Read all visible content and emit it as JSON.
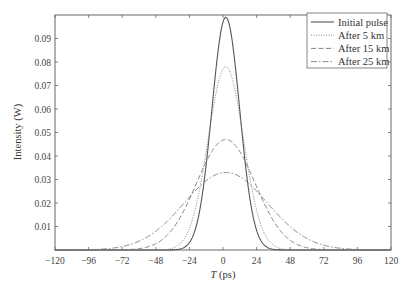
{
  "chart_data": {
    "type": "line",
    "title": "",
    "xlabel": "T (ps)",
    "xlabel_italic": "T",
    "xlabel_unit": " (ps)",
    "ylabel": "Intensity (W)",
    "xlim": [
      -120,
      120
    ],
    "ylim": [
      0,
      0.1
    ],
    "xticks": [
      -120,
      -96,
      -72,
      -48,
      -24,
      0,
      24,
      48,
      72,
      96,
      120
    ],
    "xtick_labels": [
      "−120",
      "−96",
      "−72",
      "−48",
      "−24",
      "0",
      "24",
      "48",
      "72",
      "96",
      "120"
    ],
    "yticks": [
      0.01,
      0.02,
      0.03,
      0.04,
      0.05,
      0.06,
      0.07,
      0.08,
      0.09
    ],
    "ytick_labels": [
      "0.01",
      "0.02",
      "0.03",
      "0.04",
      "0.05",
      "0.06",
      "0.07",
      "0.08",
      "0.09"
    ],
    "grid": false,
    "legend_position": "upper right",
    "center_T": 2,
    "series": [
      {
        "name": "Initial pulse",
        "style": "solid",
        "peak": 0.099,
        "width_T0": 14.0
      },
      {
        "name": "After 5 km",
        "style": "dotted",
        "peak": 0.078,
        "width_T0": 17.8
      },
      {
        "name": "After 15 km",
        "style": "dashed",
        "peak": 0.047,
        "width_T0": 29.5
      },
      {
        "name": "After 25 km",
        "style": "dashdot",
        "peak": 0.033,
        "width_T0": 42.0
      }
    ],
    "sample_points": {
      "T": [
        -72,
        -48,
        -24,
        -12,
        0,
        12,
        24,
        48,
        72
      ],
      "Initial pulse": [
        0.0,
        0.0,
        0.0043,
        0.0403,
        0.097,
        0.0594,
        0.0081,
        0.0,
        0.0
      ],
      "After 5 km": [
        0.0,
        0.0001,
        0.0135,
        0.0453,
        0.0768,
        0.0563,
        0.0166,
        0.0002,
        0.0
      ],
      "After 15 km": [
        0.0013,
        0.0035,
        0.0195,
        0.0358,
        0.0468,
        0.0403,
        0.0238,
        0.0032,
        0.0011
      ],
      "After 25 km": [
        0.002,
        0.0076,
        0.0213,
        0.0291,
        0.033,
        0.0305,
        0.024,
        0.0089,
        0.0017
      ]
    }
  }
}
